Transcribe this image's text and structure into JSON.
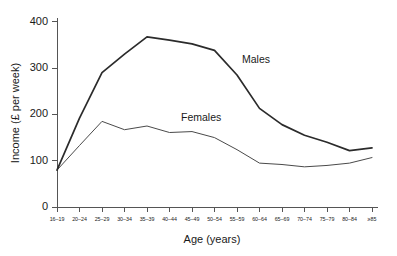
{
  "chart_data": {
    "type": "line",
    "title": "",
    "xlabel": "Age (years)",
    "ylabel": "Income (£ per week)",
    "categories": [
      "16–19",
      "20–24",
      "25–29",
      "30–34",
      "35–39",
      "40–44",
      "45–49",
      "50–54",
      "55–59",
      "60–64",
      "65–69",
      "70–74",
      "75–79",
      "80–84",
      "≥85"
    ],
    "yticks": [
      0,
      100,
      200,
      300,
      400
    ],
    "ylim": [
      0,
      420
    ],
    "grid": false,
    "legend_position": "inline-annotations",
    "series": [
      {
        "name": "Males",
        "color": "#2b2b2b",
        "values": [
          80,
          192,
          290,
          330,
          367,
          360,
          352,
          338,
          285,
          213,
          178,
          155,
          140,
          122,
          128
        ]
      },
      {
        "name": "Females",
        "color": "#4a4a4a",
        "values": [
          80,
          133,
          185,
          167,
          175,
          161,
          163,
          150,
          124,
          95,
          92,
          87,
          90,
          95,
          107
        ]
      }
    ],
    "annotations": [
      {
        "text": "Males",
        "x_px": 242,
        "y_px": 63
      },
      {
        "text": "Females",
        "x_px": 181,
        "y_px": 121
      }
    ]
  }
}
